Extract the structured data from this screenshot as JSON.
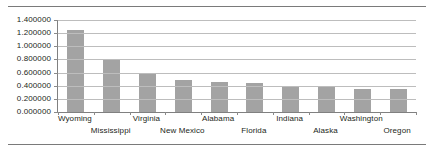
{
  "chart_data": {
    "type": "bar",
    "title": "",
    "subtitle": "",
    "xlabel": "",
    "ylabel": "",
    "categories": [
      "Wyoming",
      "Mississippi",
      "Virginia",
      "New Mexico",
      "Alabama",
      "Florida",
      "Indiana",
      "Alaska",
      "Washington",
      "Oregon"
    ],
    "values": [
      1.25,
      0.8,
      0.6,
      0.49,
      0.46,
      0.44,
      0.4,
      0.38,
      0.35,
      0.35
    ],
    "series": [
      {
        "name": "",
        "values": [
          1.25,
          0.8,
          0.6,
          0.49,
          0.46,
          0.44,
          0.4,
          0.38,
          0.35,
          0.35
        ]
      }
    ],
    "ylim": [
      0.0,
      1.4
    ],
    "xlim": [
      0,
      10
    ],
    "ytick_labels": [
      "0.000000",
      "0.200000",
      "0.400000",
      "0.600000",
      "0.800000",
      "1.000000",
      "1.200000",
      "1.400000"
    ],
    "ytick_values": [
      0.0,
      0.2,
      0.4,
      0.6,
      0.8,
      1.0,
      1.2,
      1.4
    ],
    "grid": true,
    "grid_axis": "y",
    "legend": false,
    "legend_position": "none",
    "annotations": [],
    "bar_color": "#a3a3a3",
    "gridline_color": "#bdbdbd",
    "axis_color": "#808080",
    "text_color": "#231f20",
    "background_color": "#ffffff",
    "xlabel_stagger": true
  },
  "figure": {
    "top_rule": true,
    "bottom_rule": true,
    "rule_color": "#7a7a7a"
  }
}
